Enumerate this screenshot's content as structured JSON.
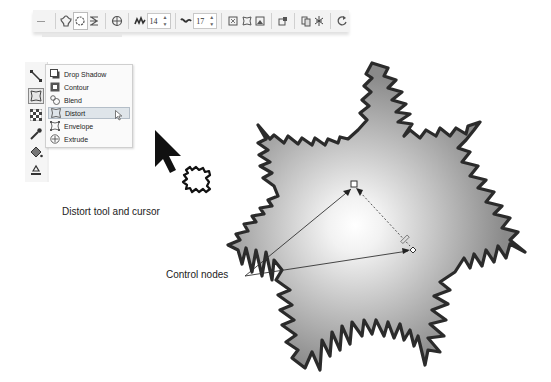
{
  "toolbar": {
    "items": [
      {
        "name": "add-perspective-icon"
      },
      {
        "name": "push-pull-distortion-icon"
      },
      {
        "name": "zipper-distortion-icon"
      },
      {
        "name": "twister-distortion-icon"
      },
      {
        "name": "center-distortion-icon"
      }
    ],
    "amplitude_value": "14",
    "frequency_value": "17",
    "right_items": [
      {
        "name": "random-distortion-icon"
      },
      {
        "name": "smooth-distortion-icon"
      },
      {
        "name": "local-distortion-icon"
      },
      {
        "name": "convert-to-curves-icon"
      },
      {
        "name": "copy-distortion-icon"
      },
      {
        "name": "clear-distortion-icon"
      },
      {
        "name": "rotate-icon"
      }
    ]
  },
  "toolbox": {
    "tools": [
      "connector-tool",
      "effects-tool",
      "transparency-tool",
      "eyedropper-tool",
      "fill-tool",
      "interactive-fill-tool"
    ]
  },
  "flyout": {
    "items": [
      {
        "label": "Drop Shadow",
        "icon": "drop-shadow-icon"
      },
      {
        "label": "Contour",
        "icon": "contour-icon"
      },
      {
        "label": "Blend",
        "icon": "blend-icon"
      },
      {
        "label": "Distort",
        "icon": "distort-icon",
        "selected": true
      },
      {
        "label": "Envelope",
        "icon": "envelope-icon"
      },
      {
        "label": "Extrude",
        "icon": "extrude-icon"
      }
    ]
  },
  "captions": {
    "distort_tool": "Distort tool and cursor",
    "control_nodes": "Control nodes"
  },
  "colors": {
    "star_outline": "#2b2b2b",
    "star_fill_center": "#ffffff",
    "star_fill_edge": "#8e8e8e",
    "menu_selected": "#dfe5ea"
  }
}
